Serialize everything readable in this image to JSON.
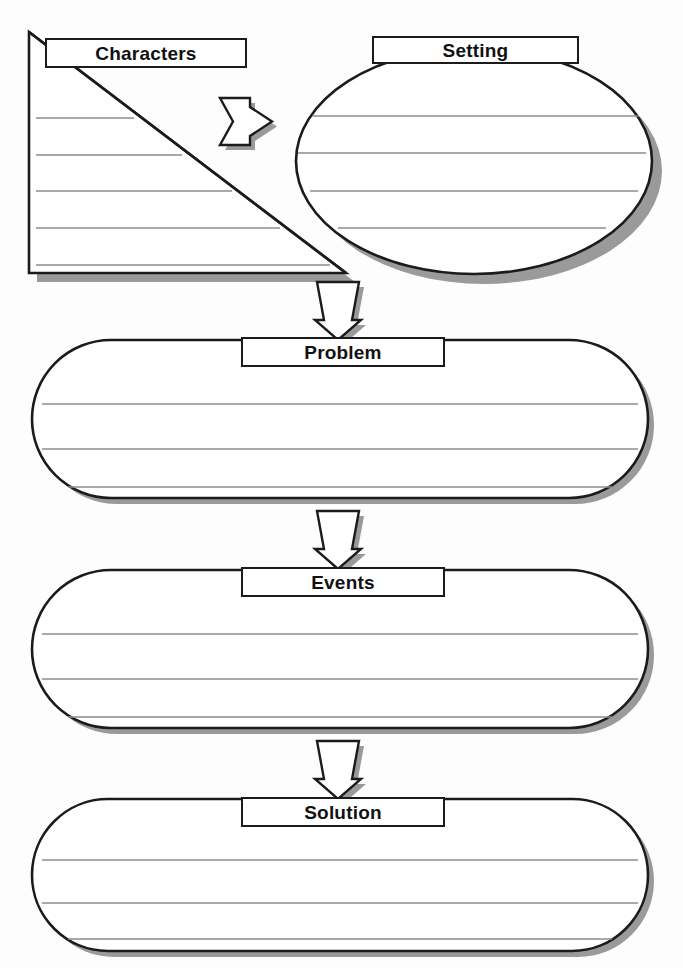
{
  "document": {
    "type": "story-map-graphic-organizer",
    "title": "Story Map",
    "background_color": "#fdfdfd",
    "ink_color": "#1b1b1b",
    "rule_line_color": "#8c8c8c",
    "shadow_color": "#9a9a9a",
    "width": 683,
    "height": 968
  },
  "sections": {
    "characters": {
      "label": "Characters",
      "shape": "triangle",
      "write_lines": 5
    },
    "setting": {
      "label": "Setting",
      "shape": "ellipse",
      "write_lines": 4
    },
    "problem": {
      "label": "Problem",
      "shape": "pill",
      "write_lines": 3
    },
    "events": {
      "label": "Events",
      "shape": "pill",
      "write_lines": 3
    },
    "solution": {
      "label": "Solution",
      "shape": "pill",
      "write_lines": 3
    }
  },
  "connectors": {
    "characters_to_setting": {
      "direction": "right",
      "style": "block-pennant-arrow"
    },
    "top_to_problem": {
      "direction": "down",
      "style": "block-pennant-arrow"
    },
    "problem_to_events": {
      "direction": "down",
      "style": "block-pennant-arrow"
    },
    "events_to_solution": {
      "direction": "down",
      "style": "block-pennant-arrow"
    }
  }
}
